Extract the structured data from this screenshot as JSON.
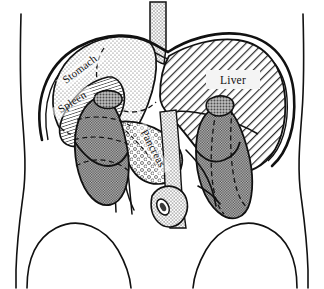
{
  "figure": {
    "type": "line-drawing",
    "background_color": "#ffffff",
    "stroke_color": "#111111",
    "view": "anterior / frontal torso projection"
  },
  "labels": {
    "stomach": "Stomach",
    "spleen": "Spleen",
    "liver": "Liver",
    "pancreas": "Pancreas"
  },
  "organs": [
    {
      "key": "liver",
      "label": "Liver",
      "fill_style": "diagonal-hatch",
      "fill_color": "#c9c9c9",
      "side": "right",
      "label_box": true
    },
    {
      "key": "stomach",
      "label": "Stomach",
      "fill_style": "stipple",
      "fill_color": "#dedede",
      "side": "left",
      "label_box": false
    },
    {
      "key": "spleen",
      "label": "Spleen",
      "fill_style": "fine-hatch",
      "fill_color": "#d4d4d4",
      "side": "left",
      "label_box": false
    },
    {
      "key": "pancreas",
      "label": "Pancreas",
      "fill_style": "lobular-dots",
      "fill_color": "#e2e2e2",
      "side": "center",
      "label_box": false
    },
    {
      "key": "kidney-left",
      "label": "",
      "fill_style": "checker-grey",
      "fill_color": "#9d9d9d",
      "side": "left",
      "label_box": false
    },
    {
      "key": "kidney-right",
      "label": "",
      "fill_style": "checker-grey",
      "fill_color": "#9d9d9d",
      "side": "right",
      "label_box": false
    },
    {
      "key": "adrenal-left",
      "label": "",
      "fill_style": "checker-grey",
      "fill_color": "#a8a8a8",
      "side": "left",
      "label_box": false
    },
    {
      "key": "adrenal-right",
      "label": "",
      "fill_style": "checker-grey",
      "fill_color": "#a8a8a8",
      "side": "right",
      "label_box": false
    },
    {
      "key": "esophagus",
      "label": "",
      "fill_style": "stipple",
      "fill_color": "#cfcfcf",
      "side": "center",
      "label_box": false
    },
    {
      "key": "aorta",
      "label": "",
      "fill_style": "stipple",
      "fill_color": "#cfcfcf",
      "side": "center",
      "label_box": false
    },
    {
      "key": "vessel-cross-section",
      "label": "",
      "fill_style": "stipple",
      "fill_color": "#cfcfcf",
      "side": "center",
      "label_box": false
    }
  ],
  "label_placement": {
    "stomach": {
      "x": 82,
      "y": 72,
      "rotate": -37
    },
    "spleen": {
      "x": 72,
      "y": 103,
      "rotate": -32
    },
    "liver": {
      "x": 232,
      "y": 82,
      "rotate": 0
    },
    "pancreas": {
      "x": 150,
      "y": 145,
      "rotate": 62
    }
  },
  "outline": {
    "body_wall": "torso with waist constriction and iliac crest arches",
    "diaphragm": "double-stroke dome across upper abdomen"
  }
}
